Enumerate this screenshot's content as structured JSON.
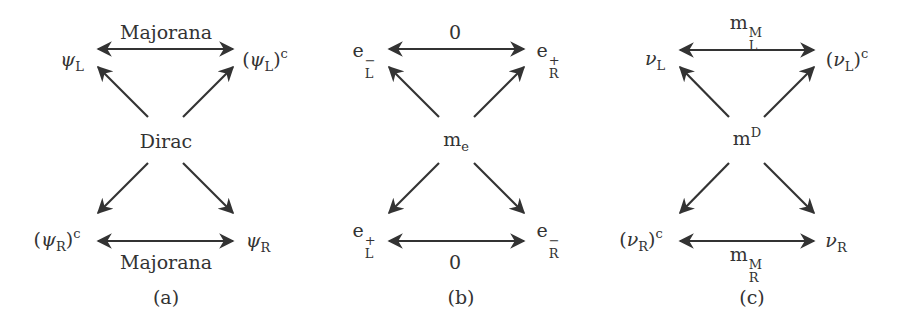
{
  "panels": [
    {
      "id": "a",
      "caption": "(a)",
      "center": "Dirac",
      "top_left": {
        "base": "ψ",
        "sub": "L",
        "paren": false,
        "sup": ""
      },
      "top_right": {
        "base": "ψ",
        "sub": "L",
        "paren": true,
        "sup": "c"
      },
      "bottom_left": {
        "base": "ψ",
        "sub": "R",
        "paren": true,
        "sup": "c"
      },
      "bottom_right": {
        "base": "ψ",
        "sub": "R",
        "paren": false,
        "sup": ""
      },
      "top_edge_label": "Majorana",
      "bottom_edge_label": "Majorana"
    },
    {
      "id": "b",
      "caption": "(b)",
      "center": {
        "base": "m",
        "sub": "e"
      },
      "top_left": {
        "base": "e",
        "sup": "−",
        "sub": "L"
      },
      "top_right": {
        "base": "e",
        "sup": "+",
        "sub": "R"
      },
      "bottom_left": {
        "base": "e",
        "sup": "+",
        "sub": "L"
      },
      "bottom_right": {
        "base": "e",
        "sup": "−",
        "sub": "R"
      },
      "top_edge_label": "0",
      "bottom_edge_label": "0"
    },
    {
      "id": "c",
      "caption": "(c)",
      "center": {
        "base": "m",
        "sup": "D"
      },
      "top_left": {
        "base": "ν",
        "sub": "L",
        "paren": false,
        "sup": ""
      },
      "top_right": {
        "base": "ν",
        "sub": "L",
        "paren": true,
        "sup": "c"
      },
      "bottom_left": {
        "base": "ν",
        "sub": "R",
        "paren": true,
        "sup": "c"
      },
      "bottom_right": {
        "base": "ν",
        "sub": "R",
        "paren": false,
        "sup": ""
      },
      "top_edge_label": {
        "base": "m",
        "sup": "M",
        "sub": "L"
      },
      "bottom_edge_label": {
        "base": "m",
        "sup": "M",
        "sub": "R"
      }
    }
  ],
  "colors": {
    "ink": "#333333",
    "background": "#ffffff"
  }
}
